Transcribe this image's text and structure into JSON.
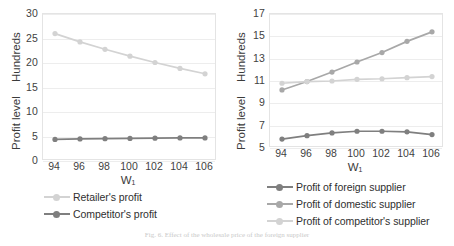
{
  "figure": {
    "caption": "Fig. 6. Effect of the wholesale price of the foreign supplier"
  },
  "colors": {
    "light": "#d3d3d3",
    "medium": "#a8a8a8",
    "dark": "#7f7f7f",
    "grid": "#ededed",
    "border": "#e4e4e4",
    "text": "#3b3b3b"
  },
  "chart_data": [
    {
      "type": "line",
      "id": "left-chart",
      "title": "",
      "xlabel": "W₁",
      "ylabel": "Profit level",
      "yunit": "Hundreds",
      "categories": [
        94,
        96,
        98,
        100,
        102,
        104,
        106
      ],
      "xticks": [
        "94",
        "96",
        "98",
        "100",
        "102",
        "104",
        "106"
      ],
      "yticks": [
        "0",
        "5",
        "10",
        "15",
        "20",
        "25",
        "30"
      ],
      "ylim": [
        0,
        30
      ],
      "grid": true,
      "legend_position": "bottom",
      "series": [
        {
          "name": "Retailer's profit",
          "color": "#d3d3d3",
          "values": [
            26.0,
            24.3,
            22.8,
            21.4,
            20.1,
            18.9,
            17.8
          ]
        },
        {
          "name": "Competitor's profit",
          "color": "#7f7f7f",
          "values": [
            4.4,
            4.5,
            4.55,
            4.6,
            4.65,
            4.7,
            4.7
          ]
        }
      ]
    },
    {
      "type": "line",
      "id": "right-chart",
      "title": "",
      "xlabel": "W₁",
      "ylabel": "Profit level",
      "yunit": "Hundreds",
      "categories": [
        94,
        96,
        98,
        100,
        102,
        104,
        106
      ],
      "xticks": [
        "94",
        "96",
        "98",
        "100",
        "102",
        "104",
        "106"
      ],
      "yticks": [
        "5",
        "7",
        "9",
        "11",
        "13",
        "15",
        "17"
      ],
      "ylim": [
        5,
        17
      ],
      "grid": true,
      "legend_position": "bottom",
      "series": [
        {
          "name": "Profit of foreign supplier",
          "color": "#7f7f7f",
          "values": [
            5.8,
            6.1,
            6.35,
            6.5,
            6.5,
            6.45,
            6.2
          ]
        },
        {
          "name": "Profit of domestic supplier",
          "color": "#a8a8a8",
          "values": [
            10.2,
            10.95,
            11.8,
            12.7,
            13.55,
            14.55,
            15.4
          ]
        },
        {
          "name": "Profit of competitor's supplier",
          "color": "#d3d3d3",
          "values": [
            10.8,
            10.95,
            11.0,
            11.15,
            11.2,
            11.3,
            11.4
          ]
        }
      ]
    }
  ]
}
